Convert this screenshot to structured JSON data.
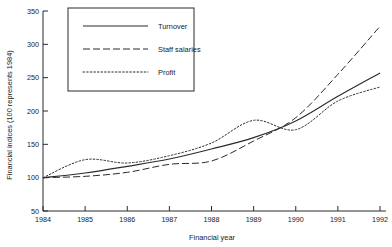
{
  "chart_data": {
    "type": "line",
    "title": "",
    "xlabel": "Financial year",
    "ylabel": "Financial indices (100 represents 1984)",
    "x": [
      1984,
      1985,
      1986,
      1987,
      1988,
      1989,
      1990,
      1991,
      1992
    ],
    "xticklabels": [
      "1984",
      "1985",
      "1986",
      "1987",
      "1988",
      "1989",
      "1990",
      "1991",
      "1992"
    ],
    "yticklabels": [
      "50",
      "100",
      "150",
      "200",
      "250",
      "300",
      "350"
    ],
    "yticks": [
      50,
      100,
      150,
      200,
      250,
      300,
      350
    ],
    "xlim": [
      1984,
      1992
    ],
    "ylim": [
      50,
      350
    ],
    "grid": false,
    "legend_position": "upper-left-inset",
    "series": [
      {
        "name": "Turnover",
        "style": "solid",
        "color": "#2b2b2b",
        "values": [
          100,
          107,
          117,
          128,
          143,
          160,
          185,
          222,
          257
        ]
      },
      {
        "name": "Staff salaries",
        "style": "dashed",
        "color": "#2b2b2b",
        "values": [
          100,
          102,
          108,
          120,
          125,
          155,
          190,
          255,
          327
        ]
      },
      {
        "name": "Profit",
        "style": "dotted",
        "color": "#2b2b2b",
        "values": [
          100,
          127,
          122,
          133,
          152,
          186,
          172,
          215,
          236
        ]
      }
    ]
  },
  "legend": {
    "entries": [
      {
        "label": "Turnover"
      },
      {
        "label": "Staff salaries"
      },
      {
        "label": "Profit"
      }
    ]
  }
}
